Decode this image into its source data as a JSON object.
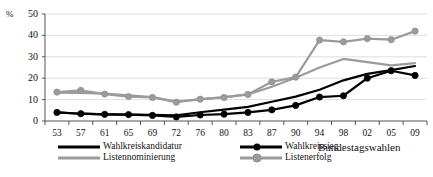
{
  "chart_data": {
    "type": "line",
    "title": "",
    "xlabel": "Bundestagswahlen",
    "ylabel": "%",
    "ylim": [
      0,
      50
    ],
    "yticks": [
      0,
      10,
      20,
      30,
      40,
      50
    ],
    "grid": true,
    "legend_position": "bottom",
    "categories": [
      "53",
      "57",
      "61",
      "65",
      "69",
      "72",
      "76",
      "80",
      "83",
      "87",
      "90",
      "94",
      "98",
      "02",
      "05",
      "09"
    ],
    "series": [
      {
        "name": "Wahlkreiskandidatur",
        "color": "#000000",
        "marker": "none",
        "values": [
          4.0,
          3.4,
          3.1,
          3.0,
          2.9,
          2.6,
          4.1,
          5.3,
          6.6,
          9.0,
          11.4,
          14.6,
          19.0,
          22.0,
          23.8,
          25.7
        ]
      },
      {
        "name": "Wahlkreissieg",
        "color": "#000000",
        "marker": "circle",
        "values": [
          4.0,
          3.4,
          3.1,
          3.0,
          2.6,
          1.9,
          2.8,
          3.2,
          4.0,
          5.2,
          7.3,
          11.2,
          11.8,
          20.0,
          23.5,
          21.3
        ]
      },
      {
        "name": "Listennominierung",
        "color": "#9b9b9b",
        "marker": "none",
        "values": [
          13.3,
          13.1,
          12.8,
          12.0,
          11.2,
          9.1,
          10.1,
          11.2,
          12.4,
          16.0,
          20.2,
          25.0,
          29.0,
          27.5,
          26.0,
          27.0
        ]
      },
      {
        "name": "Listenerfolg",
        "color": "#9b9b9b",
        "marker": "circle",
        "values": [
          13.5,
          14.3,
          12.6,
          11.4,
          11.0,
          8.8,
          10.2,
          11.0,
          12.4,
          18.3,
          20.5,
          37.8,
          37.0,
          38.5,
          38.0,
          42.0
        ]
      }
    ]
  },
  "legend": {
    "items": [
      {
        "label": "Wahlkreiskandidatur"
      },
      {
        "label": "Wahlkreissieg"
      },
      {
        "label": "Listennominierung"
      },
      {
        "label": "Listenerfolg"
      }
    ]
  },
  "axis_title": {
    "x": "Bundestagswahlen"
  }
}
